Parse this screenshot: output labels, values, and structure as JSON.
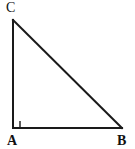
{
  "figure": {
    "kind": "right-triangle-diagram",
    "background_color": "#ffffff",
    "stroke_color": "#1a1a1a",
    "stroke_width": 2,
    "canvas": {
      "width": 135,
      "height": 149
    },
    "vertices": [
      {
        "id": "C",
        "label": "C",
        "x": 13,
        "y": 20,
        "label_x": 6,
        "label_y": 1,
        "bold": false
      },
      {
        "id": "A",
        "label": "A",
        "x": 13,
        "y": 128,
        "label_x": 7,
        "label_y": 134,
        "bold": true
      },
      {
        "id": "B",
        "label": "B",
        "x": 122,
        "y": 128,
        "label_x": 117,
        "label_y": 134,
        "bold": true
      }
    ],
    "sides": [
      {
        "id": "CA",
        "from": "C",
        "to": "A",
        "role": "vertical-leg"
      },
      {
        "id": "AB",
        "from": "A",
        "to": "B",
        "role": "horizontal-leg"
      },
      {
        "id": "CB",
        "from": "C",
        "to": "B",
        "role": "hypotenuse"
      }
    ],
    "right_angle": {
      "at_vertex": "A",
      "marker": "square",
      "size": 7,
      "x": 13,
      "y": 121,
      "stroke_width": 1.4
    },
    "path_points": "13,20 13,128 122,128"
  }
}
